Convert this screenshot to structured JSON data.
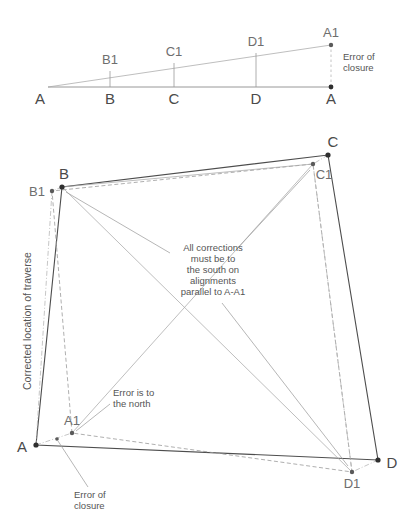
{
  "figure": {
    "title": "",
    "background_color": "#ffffff",
    "ink_color": "#4d4d4d",
    "label_color": "#6e6e6e"
  },
  "top_diagram": {
    "name": "error-distribution-line-diagram",
    "baseline_labels": [
      "A",
      "B",
      "C",
      "D",
      "A"
    ],
    "offset_labels": [
      "B1",
      "C1",
      "D1",
      "A1"
    ],
    "annotation": {
      "line1": "Error of",
      "line2": "closure"
    },
    "baseline_points": [
      {
        "label": "A",
        "x": 48,
        "y": 87
      },
      {
        "label": "B",
        "x": 110,
        "y": 87
      },
      {
        "label": "C",
        "x": 174,
        "y": 87
      },
      {
        "label": "D",
        "x": 256,
        "y": 87
      },
      {
        "label": "A",
        "x": 331,
        "y": 87
      }
    ],
    "offset_points": [
      {
        "label": "B1",
        "x": 110,
        "y": 71
      },
      {
        "label": "C1",
        "x": 174,
        "y": 63
      },
      {
        "label": "D1",
        "x": 256,
        "y": 53
      },
      {
        "label": "A1",
        "x": 331,
        "y": 45
      }
    ]
  },
  "main_diagram": {
    "name": "closed-traverse-adjustment-diagram",
    "measured_vertices": [
      {
        "label": "A",
        "x": 36,
        "y": 445
      },
      {
        "label": "B",
        "x": 62,
        "y": 187
      },
      {
        "label": "C",
        "x": 328,
        "y": 155
      },
      {
        "label": "D",
        "x": 378,
        "y": 460
      }
    ],
    "corrected_vertices": [
      {
        "label": "A1",
        "x": 72,
        "y": 433
      },
      {
        "label": "B1",
        "x": 52,
        "y": 191
      },
      {
        "label": "C1",
        "x": 313,
        "y": 164
      },
      {
        "label": "D1",
        "x": 352,
        "y": 472
      }
    ],
    "axis_label": "Corrected location of traverse",
    "annotations": {
      "corrections_note": [
        "All corrections",
        "must be to",
        "the south on",
        "alignments",
        "parallel to A-A1"
      ],
      "error_north": [
        "Error is to",
        "the north"
      ],
      "error_closure": [
        "Error of",
        "closure"
      ]
    }
  }
}
